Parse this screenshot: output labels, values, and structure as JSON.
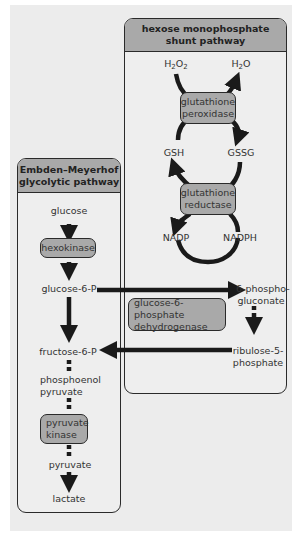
{
  "colors": {
    "panel_bg": "#ececec",
    "box_bg": "#eeeeee",
    "header_bg": "#a9a9a9",
    "enzyme_bg": "#a9a9a9",
    "arrow": "#1a1a1a",
    "text": "#333333"
  },
  "hmp": {
    "title_line1": "hexose monophosphate",
    "title_line2": "shunt pathway",
    "h2o2_main": "H",
    "h2o2_sub1": "2",
    "h2o2_o": "O",
    "h2o2_sub2": "2",
    "h2o_main": "H",
    "h2o_sub": "2",
    "h2o_o": "O",
    "gpx_line1": "glutathione",
    "gpx_line2": "peroxidase",
    "gsh": "GSH",
    "gssg": "GSSG",
    "gr_line1": "glutathione",
    "gr_line2": "reductase",
    "nadp": "NADP",
    "nadph": "NADPH",
    "pg_line1": "6-phospho-",
    "pg_line2": "gluconate",
    "g6pd_line1": "glucose-6-phosphate",
    "g6pd_line2": "dehydrogenase",
    "r5p_line1": "ribulose-5-",
    "r5p_line2": "phosphate"
  },
  "glycolysis": {
    "title_line1": "Embden–Meyerhof",
    "title_line2": "glycolytic pathway",
    "glucose": "glucose",
    "hexokinase": "hexokinase",
    "g6p": "glucose-6-P",
    "f6p": "fructose-6-P",
    "pep_line1": "phosphoenol",
    "pep_line2": "pyruvate",
    "pk_line1": "pyruvate",
    "pk_line2": "kinase",
    "pyruvate": "pyruvate",
    "lactate": "lactate"
  }
}
